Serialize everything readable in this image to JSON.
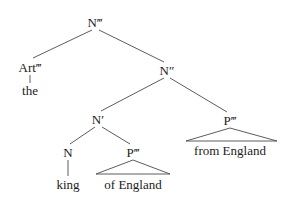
{
  "figure": {
    "type": "x-bar-syntax-tree",
    "background_color": "#ffffff",
    "line_color": "#4a4a4a",
    "text_color": "#1c1c1c"
  },
  "nodes": {
    "root": {
      "label": "N‴",
      "x": 95,
      "y": 22
    },
    "art_max": {
      "label": "Art‴",
      "x": 30,
      "y": 67
    },
    "n_double": {
      "label": "N″",
      "x": 167,
      "y": 70
    },
    "n_bar": {
      "label": "N′",
      "x": 98,
      "y": 119
    },
    "p_max_right": {
      "label": "P‴",
      "x": 230,
      "y": 120
    },
    "n_head": {
      "label": "N",
      "x": 68,
      "y": 152
    },
    "p_max_left": {
      "label": "P‴",
      "x": 133,
      "y": 152
    }
  },
  "terminals": {
    "the": {
      "label": "the",
      "x": 30,
      "y": 90
    },
    "king": {
      "label": "king",
      "x": 68,
      "y": 184
    },
    "of_england": {
      "label": "of England",
      "x": 133,
      "y": 184
    },
    "from_england": {
      "label": "from England",
      "x": 230,
      "y": 150
    }
  },
  "triangles": [
    {
      "name": "of-england-triangle",
      "apex_x": 133,
      "apex_y": 160,
      "left_x": 96,
      "right_x": 170,
      "base_y": 174
    },
    {
      "name": "from-england-triangle",
      "apex_x": 230,
      "apex_y": 128,
      "left_x": 186,
      "right_x": 277,
      "base_y": 141
    }
  ],
  "branches": [
    {
      "name": "root-to-art",
      "x1": 92,
      "y1": 30,
      "x2": 33,
      "y2": 58
    },
    {
      "name": "root-to-n-double",
      "x1": 99,
      "y1": 30,
      "x2": 164,
      "y2": 62
    },
    {
      "name": "n-double-to-n-bar",
      "x1": 164,
      "y1": 78,
      "x2": 101,
      "y2": 111
    },
    {
      "name": "n-double-to-p-max-right",
      "x1": 170,
      "y1": 78,
      "x2": 227,
      "y2": 112
    },
    {
      "name": "n-bar-to-n-head",
      "x1": 95,
      "y1": 127,
      "x2": 70,
      "y2": 144
    },
    {
      "name": "n-bar-to-p-max-left",
      "x1": 102,
      "y1": 127,
      "x2": 130,
      "y2": 144
    },
    {
      "name": "art-to-the",
      "x1": 30,
      "y1": 75,
      "x2": 30,
      "y2": 83
    },
    {
      "name": "n-head-to-king",
      "x1": 68,
      "y1": 160,
      "x2": 68,
      "y2": 176
    }
  ]
}
